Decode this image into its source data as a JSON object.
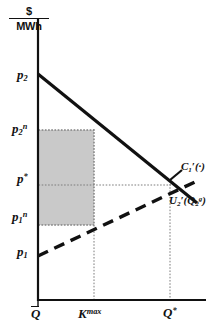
{
  "figure": {
    "kind": "economics-supply-demand-diagram",
    "background_color": "#ffffff",
    "ink_color": "#111111",
    "shaded_region_color": "#c9c9c9",
    "y_axis_unit": {
      "numerator": "$",
      "denominator": "MWh"
    },
    "y_axis_ticks": [
      {
        "id": "p2",
        "label_html": "p<sub>2</sub>",
        "plain": "p2"
      },
      {
        "id": "p2n",
        "label_html": "p<sub>2</sub><sup>n</sup>",
        "plain": "p2^n"
      },
      {
        "id": "pstar",
        "label_html": "p<sup>*</sup>",
        "plain": "p*"
      },
      {
        "id": "p1n",
        "label_html": "p<sub>1</sub><sup>n</sup>",
        "plain": "p1^n"
      },
      {
        "id": "p1",
        "label_html": "p<sub>1</sub>",
        "plain": "p1"
      }
    ],
    "x_axis_ticks": [
      {
        "id": "qbar",
        "label_html": "<span class=\"overbar\">Q</span>",
        "plain": "Qbar"
      },
      {
        "id": "kmax",
        "label_html": "K<sup>max</sup>",
        "plain": "K^max"
      },
      {
        "id": "qstar",
        "label_html": "Q<sup>*</sup>",
        "plain": "Q*"
      }
    ],
    "curves": [
      {
        "id": "marginal-cost",
        "label_html": "C<sub>1</sub><span class=\"prime\">&prime;</span>(&middot;)",
        "plain": "C1'(.)",
        "style": "solid",
        "slope": "decreasing"
      },
      {
        "id": "marginal-utility",
        "label_html": "U<sub>2</sub><span class=\"prime\">&prime;</span>(Q<sub>2</sub><sup>g</sup>)",
        "plain": "U2'(Q2^g)",
        "style": "dashed",
        "slope": "increasing"
      }
    ]
  },
  "chart_data": {
    "type": "line",
    "title": "",
    "xlabel": "",
    "ylabel": "$/MWh",
    "grid": false,
    "legend_position": "inline-right",
    "xlim": [
      38,
      205
    ],
    "ylim_pixels": [
      300,
      18
    ],
    "axis_ticks": {
      "y": [
        "p2",
        "p2^n",
        "p*",
        "p1^n",
        "p1"
      ],
      "x": [
        "Qbar",
        "K^max",
        "Q*"
      ]
    },
    "series": [
      {
        "name": "C1'(.)",
        "style": "solid",
        "points": [
          [
            38,
            75
          ],
          [
            94,
            130
          ],
          [
            170,
            185
          ],
          [
            196,
            202
          ]
        ]
      },
      {
        "name": "U2'(Q2^g)",
        "style": "dashed",
        "points": [
          [
            38,
            256
          ],
          [
            94,
            225
          ],
          [
            170,
            190
          ],
          [
            196,
            182
          ]
        ]
      }
    ],
    "guides": [
      {
        "orientation": "horizontal",
        "at": "p2^n",
        "y": 130,
        "from_x": 38,
        "to_x": 94
      },
      {
        "orientation": "horizontal",
        "at": "p*",
        "y": 185,
        "from_x": 38,
        "to_x": 170
      },
      {
        "orientation": "horizontal",
        "at": "p1^n",
        "y": 225,
        "from_x": 38,
        "to_x": 94
      },
      {
        "orientation": "vertical",
        "at": "K^max",
        "x": 94,
        "from_y": 130,
        "to_y": 300
      },
      {
        "orientation": "vertical",
        "at": "Q*",
        "x": 170,
        "from_y": 185,
        "to_y": 300
      }
    ],
    "shaded_rectangle": {
      "x_from": "Qbar",
      "x_to": "K^max",
      "y_from": "p1^n",
      "y_to": "p2^n",
      "pixels": {
        "x": 38,
        "y": 130,
        "width": 56,
        "height": 95
      },
      "fill": "#c9c9c9",
      "meaning": "congestion rent / quantity-rectangle"
    },
    "annotations": [
      {
        "text": "C1'(.)",
        "x": 181,
        "y": 166
      },
      {
        "text": "U2'(Q2^g)",
        "x": 169,
        "y": 200
      }
    ]
  }
}
